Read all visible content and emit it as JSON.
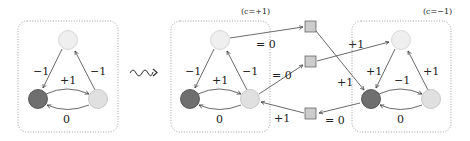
{
  "colors": {
    "node_dark": "#6f6f6f",
    "node_light": "#e0e0e0",
    "node_top": "#efefef",
    "square": "#cccccc",
    "stroke": "#444444",
    "box": "#888888"
  },
  "left_graph": {
    "edges": {
      "top_to_left": "−1",
      "right_to_top": "−1",
      "left_to_right": "+1",
      "right_to_left": "0"
    }
  },
  "transform_icon": "squiggle-arrow",
  "middle_graph": {
    "caption": "(c=+1)",
    "edges": {
      "top_to_left": "−1",
      "right_to_top": "−1",
      "left_to_right": "+1",
      "right_to_left": "0"
    },
    "out_labels": {
      "top_to_sq1": "= 0",
      "right_to_sq2": "= 0",
      "sq3_to_right": "+1"
    }
  },
  "right_graph": {
    "caption": "(c=−1)",
    "edges": {
      "top_to_left": "+1",
      "right_to_top": "+1",
      "left_to_right": "−1",
      "right_to_left": "0"
    },
    "in_labels": {
      "sq2_to_top": "+1",
      "sq1_to_left": "+1",
      "left_to_sq3": "= 0"
    }
  }
}
